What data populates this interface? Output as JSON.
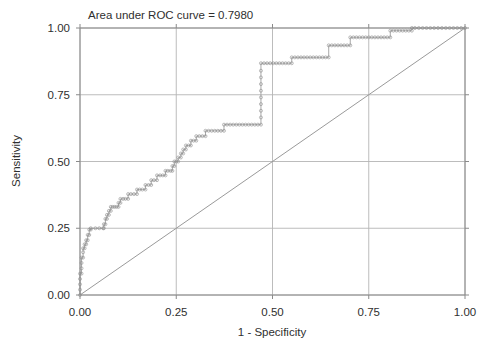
{
  "chart_data": {
    "type": "line",
    "title": "Area under ROC curve = 0.7980",
    "xlabel": "1 - Specificity",
    "ylabel": "Sensitivity",
    "xlim": [
      0,
      1
    ],
    "ylim": [
      0,
      1
    ],
    "grid": true,
    "legend": "none",
    "auc": 0.798,
    "xticks": [
      "0.00",
      "0.25",
      "0.50",
      "0.75",
      "1.00"
    ],
    "xtick_values": [
      0,
      0.25,
      0.5,
      0.75,
      1
    ],
    "yticks": [
      "0.00",
      "0.25",
      "0.50",
      "0.75",
      "1.00"
    ],
    "ytick_values": [
      0,
      0.25,
      0.5,
      0.75,
      1
    ],
    "series": [
      {
        "name": "ROC curve",
        "marker": "open-circle",
        "style": "step",
        "points": [
          [
            0.0,
            0.0
          ],
          [
            0.0,
            0.02
          ],
          [
            0.0,
            0.04
          ],
          [
            0.0,
            0.06
          ],
          [
            0.0,
            0.08
          ],
          [
            0.004,
            0.08
          ],
          [
            0.004,
            0.1
          ],
          [
            0.004,
            0.12
          ],
          [
            0.004,
            0.14
          ],
          [
            0.008,
            0.14
          ],
          [
            0.008,
            0.16
          ],
          [
            0.008,
            0.175
          ],
          [
            0.012,
            0.175
          ],
          [
            0.012,
            0.19
          ],
          [
            0.016,
            0.19
          ],
          [
            0.016,
            0.205
          ],
          [
            0.02,
            0.205
          ],
          [
            0.02,
            0.225
          ],
          [
            0.024,
            0.225
          ],
          [
            0.024,
            0.245
          ],
          [
            0.028,
            0.245
          ],
          [
            0.028,
            0.25
          ],
          [
            0.04,
            0.25
          ],
          [
            0.05,
            0.25
          ],
          [
            0.06,
            0.25
          ],
          [
            0.062,
            0.25
          ],
          [
            0.062,
            0.265
          ],
          [
            0.066,
            0.265
          ],
          [
            0.066,
            0.285
          ],
          [
            0.07,
            0.285
          ],
          [
            0.07,
            0.3
          ],
          [
            0.075,
            0.3
          ],
          [
            0.075,
            0.315
          ],
          [
            0.08,
            0.315
          ],
          [
            0.08,
            0.33
          ],
          [
            0.085,
            0.33
          ],
          [
            0.09,
            0.33
          ],
          [
            0.095,
            0.33
          ],
          [
            0.1,
            0.33
          ],
          [
            0.1,
            0.345
          ],
          [
            0.105,
            0.345
          ],
          [
            0.105,
            0.36
          ],
          [
            0.112,
            0.36
          ],
          [
            0.118,
            0.36
          ],
          [
            0.125,
            0.36
          ],
          [
            0.125,
            0.378
          ],
          [
            0.132,
            0.378
          ],
          [
            0.14,
            0.378
          ],
          [
            0.148,
            0.378
          ],
          [
            0.148,
            0.395
          ],
          [
            0.155,
            0.395
          ],
          [
            0.162,
            0.395
          ],
          [
            0.17,
            0.395
          ],
          [
            0.17,
            0.412
          ],
          [
            0.178,
            0.412
          ],
          [
            0.185,
            0.412
          ],
          [
            0.185,
            0.43
          ],
          [
            0.192,
            0.43
          ],
          [
            0.2,
            0.43
          ],
          [
            0.2,
            0.448
          ],
          [
            0.208,
            0.448
          ],
          [
            0.215,
            0.448
          ],
          [
            0.222,
            0.448
          ],
          [
            0.222,
            0.465
          ],
          [
            0.228,
            0.465
          ],
          [
            0.235,
            0.465
          ],
          [
            0.24,
            0.465
          ],
          [
            0.24,
            0.483
          ],
          [
            0.245,
            0.483
          ],
          [
            0.245,
            0.5
          ],
          [
            0.25,
            0.5
          ],
          [
            0.255,
            0.5
          ],
          [
            0.255,
            0.515
          ],
          [
            0.262,
            0.515
          ],
          [
            0.262,
            0.53
          ],
          [
            0.268,
            0.53
          ],
          [
            0.268,
            0.545
          ],
          [
            0.275,
            0.545
          ],
          [
            0.275,
            0.56
          ],
          [
            0.282,
            0.56
          ],
          [
            0.288,
            0.56
          ],
          [
            0.288,
            0.578
          ],
          [
            0.295,
            0.578
          ],
          [
            0.302,
            0.578
          ],
          [
            0.302,
            0.595
          ],
          [
            0.31,
            0.595
          ],
          [
            0.318,
            0.595
          ],
          [
            0.326,
            0.595
          ],
          [
            0.326,
            0.615
          ],
          [
            0.334,
            0.615
          ],
          [
            0.342,
            0.615
          ],
          [
            0.35,
            0.615
          ],
          [
            0.358,
            0.615
          ],
          [
            0.366,
            0.615
          ],
          [
            0.374,
            0.615
          ],
          [
            0.374,
            0.638
          ],
          [
            0.382,
            0.638
          ],
          [
            0.39,
            0.638
          ],
          [
            0.398,
            0.638
          ],
          [
            0.406,
            0.638
          ],
          [
            0.414,
            0.638
          ],
          [
            0.422,
            0.638
          ],
          [
            0.43,
            0.638
          ],
          [
            0.438,
            0.638
          ],
          [
            0.446,
            0.638
          ],
          [
            0.454,
            0.638
          ],
          [
            0.462,
            0.638
          ],
          [
            0.47,
            0.638
          ],
          [
            0.47,
            0.665
          ],
          [
            0.47,
            0.69
          ],
          [
            0.47,
            0.715
          ],
          [
            0.47,
            0.74
          ],
          [
            0.47,
            0.765
          ],
          [
            0.47,
            0.79
          ],
          [
            0.47,
            0.815
          ],
          [
            0.47,
            0.84
          ],
          [
            0.47,
            0.868
          ],
          [
            0.478,
            0.868
          ],
          [
            0.486,
            0.868
          ],
          [
            0.494,
            0.868
          ],
          [
            0.502,
            0.868
          ],
          [
            0.51,
            0.868
          ],
          [
            0.518,
            0.868
          ],
          [
            0.526,
            0.868
          ],
          [
            0.534,
            0.868
          ],
          [
            0.542,
            0.868
          ],
          [
            0.55,
            0.868
          ],
          [
            0.55,
            0.89
          ],
          [
            0.558,
            0.89
          ],
          [
            0.566,
            0.89
          ],
          [
            0.574,
            0.89
          ],
          [
            0.582,
            0.89
          ],
          [
            0.59,
            0.89
          ],
          [
            0.598,
            0.89
          ],
          [
            0.606,
            0.89
          ],
          [
            0.614,
            0.89
          ],
          [
            0.622,
            0.89
          ],
          [
            0.63,
            0.89
          ],
          [
            0.638,
            0.89
          ],
          [
            0.646,
            0.89
          ],
          [
            0.646,
            0.935
          ],
          [
            0.654,
            0.935
          ],
          [
            0.662,
            0.935
          ],
          [
            0.67,
            0.935
          ],
          [
            0.678,
            0.935
          ],
          [
            0.686,
            0.935
          ],
          [
            0.694,
            0.935
          ],
          [
            0.702,
            0.935
          ],
          [
            0.702,
            0.965
          ],
          [
            0.71,
            0.965
          ],
          [
            0.718,
            0.965
          ],
          [
            0.726,
            0.965
          ],
          [
            0.734,
            0.965
          ],
          [
            0.742,
            0.965
          ],
          [
            0.75,
            0.965
          ],
          [
            0.758,
            0.965
          ],
          [
            0.766,
            0.965
          ],
          [
            0.774,
            0.965
          ],
          [
            0.782,
            0.965
          ],
          [
            0.79,
            0.965
          ],
          [
            0.798,
            0.965
          ],
          [
            0.806,
            0.965
          ],
          [
            0.806,
            0.99
          ],
          [
            0.814,
            0.99
          ],
          [
            0.822,
            0.99
          ],
          [
            0.83,
            0.99
          ],
          [
            0.838,
            0.99
          ],
          [
            0.846,
            0.99
          ],
          [
            0.854,
            0.99
          ],
          [
            0.862,
            0.99
          ],
          [
            0.862,
            1.0
          ],
          [
            0.87,
            1.0
          ],
          [
            0.88,
            1.0
          ],
          [
            0.89,
            1.0
          ],
          [
            0.9,
            1.0
          ],
          [
            0.91,
            1.0
          ],
          [
            0.92,
            1.0
          ],
          [
            0.93,
            1.0
          ],
          [
            0.94,
            1.0
          ],
          [
            0.95,
            1.0
          ],
          [
            0.96,
            1.0
          ],
          [
            0.97,
            1.0
          ],
          [
            0.98,
            1.0
          ],
          [
            0.99,
            1.0
          ],
          [
            1.0,
            1.0
          ]
        ]
      },
      {
        "name": "Reference diagonal",
        "marker": "none",
        "style": "line",
        "points": [
          [
            0,
            0
          ],
          [
            1,
            1
          ]
        ]
      }
    ]
  },
  "colors": {
    "background": "#ffffff",
    "axis": "#8a8a8a",
    "grid": "#b4b4b4",
    "curve": "#9f9f9f",
    "reference": "#9a9a9a",
    "text": "#2f2f2f"
  }
}
